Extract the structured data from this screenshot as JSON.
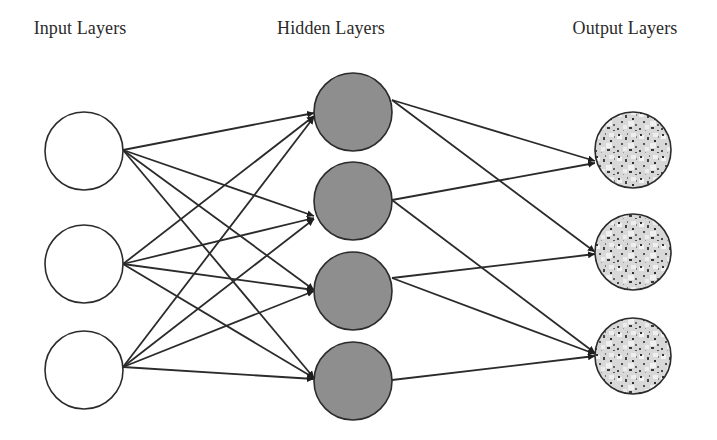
{
  "labels": {
    "input": "Input Layers",
    "hidden": "Hidden Layers",
    "output": "Output Layers"
  },
  "colors": {
    "edge": "#2b2b2b",
    "input_fill": "#ffffff",
    "hidden_fill": "#8e8e8e",
    "output_base": "#d4d4d4",
    "output_speckle": "#3a3a3a",
    "stroke": "#2b2b2b"
  },
  "layers": {
    "input": {
      "label_x": 80,
      "nodes": [
        {
          "id": "i1",
          "cx": 84,
          "cy": 151,
          "r": 39
        },
        {
          "id": "i2",
          "cx": 84,
          "cy": 264,
          "r": 39
        },
        {
          "id": "i3",
          "cx": 84,
          "cy": 370,
          "r": 39
        }
      ]
    },
    "hidden": {
      "label_x": 331,
      "nodes": [
        {
          "id": "h1",
          "cx": 353,
          "cy": 112,
          "r": 39
        },
        {
          "id": "h2",
          "cx": 353,
          "cy": 201,
          "r": 39
        },
        {
          "id": "h3",
          "cx": 353,
          "cy": 291,
          "r": 39
        },
        {
          "id": "h4",
          "cx": 353,
          "cy": 381,
          "r": 39
        }
      ]
    },
    "output": {
      "label_x": 625,
      "nodes": [
        {
          "id": "o1",
          "cx": 633,
          "cy": 150,
          "r": 38
        },
        {
          "id": "o2",
          "cx": 633,
          "cy": 252,
          "r": 38
        },
        {
          "id": "o3",
          "cx": 633,
          "cy": 356,
          "r": 38
        }
      ]
    }
  },
  "edges": [
    {
      "from": "i1",
      "to": "h1",
      "x1": 123,
      "y1": 150,
      "x2": 314,
      "y2": 113
    },
    {
      "from": "i1",
      "to": "h2",
      "x1": 123,
      "y1": 150,
      "x2": 314,
      "y2": 216
    },
    {
      "from": "i1",
      "to": "h3",
      "x1": 123,
      "y1": 150,
      "x2": 314,
      "y2": 290
    },
    {
      "from": "i1",
      "to": "h4",
      "x1": 123,
      "y1": 150,
      "x2": 314,
      "y2": 378
    },
    {
      "from": "i2",
      "to": "h1",
      "x1": 123,
      "y1": 264,
      "x2": 314,
      "y2": 116
    },
    {
      "from": "i2",
      "to": "h2",
      "x1": 123,
      "y1": 264,
      "x2": 314,
      "y2": 218
    },
    {
      "from": "i2",
      "to": "h3",
      "x1": 123,
      "y1": 264,
      "x2": 314,
      "y2": 290
    },
    {
      "from": "i2",
      "to": "h4",
      "x1": 123,
      "y1": 264,
      "x2": 314,
      "y2": 378
    },
    {
      "from": "i3",
      "to": "h1",
      "x1": 123,
      "y1": 367,
      "x2": 314,
      "y2": 117
    },
    {
      "from": "i3",
      "to": "h2",
      "x1": 123,
      "y1": 367,
      "x2": 314,
      "y2": 219
    },
    {
      "from": "i3",
      "to": "h3",
      "x1": 123,
      "y1": 367,
      "x2": 314,
      "y2": 291
    },
    {
      "from": "i3",
      "to": "h4",
      "x1": 123,
      "y1": 367,
      "x2": 314,
      "y2": 379
    },
    {
      "from": "h1",
      "to": "o1",
      "x1": 392,
      "y1": 100,
      "x2": 595,
      "y2": 161
    },
    {
      "from": "h1",
      "to": "o2",
      "x1": 392,
      "y1": 100,
      "x2": 595,
      "y2": 252
    },
    {
      "from": "h2",
      "to": "o1",
      "x1": 392,
      "y1": 200,
      "x2": 595,
      "y2": 163
    },
    {
      "from": "h2",
      "to": "o3",
      "x1": 392,
      "y1": 200,
      "x2": 595,
      "y2": 353
    },
    {
      "from": "h3",
      "to": "o2",
      "x1": 392,
      "y1": 278,
      "x2": 595,
      "y2": 254
    },
    {
      "from": "h3",
      "to": "o3",
      "x1": 392,
      "y1": 278,
      "x2": 595,
      "y2": 354
    },
    {
      "from": "h4",
      "to": "o3",
      "x1": 392,
      "y1": 380,
      "x2": 595,
      "y2": 356
    }
  ]
}
